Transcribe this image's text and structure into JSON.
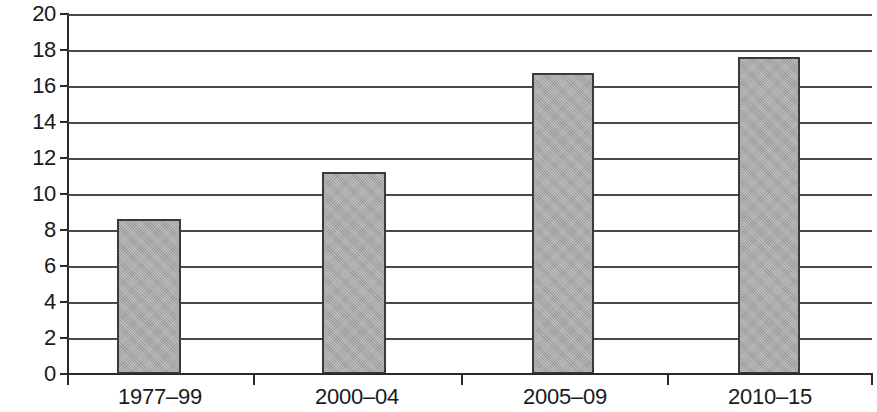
{
  "chart_data": {
    "type": "bar",
    "title": "",
    "subtitle": "",
    "xlabel": "",
    "ylabel": "",
    "categories": [
      "1977–99",
      "2000–04",
      "2005–09",
      "2010–15"
    ],
    "values": [
      8.6,
      11.2,
      16.7,
      17.6
    ],
    "series": [
      {
        "name": "",
        "values": [
          8.6,
          11.2,
          16.7,
          17.6
        ]
      }
    ],
    "ylim": [
      0,
      20
    ],
    "ytick_labels": [
      "0",
      "2",
      "4",
      "6",
      "8",
      "10",
      "12",
      "14",
      "16",
      "18",
      "20"
    ],
    "ytick_values": [
      0,
      2,
      4,
      6,
      8,
      10,
      12,
      14,
      16,
      18,
      20
    ],
    "ytick_step": 2,
    "grid": true,
    "grid_axis": "y",
    "legend": false,
    "legend_position": "none",
    "annotations": [],
    "colors": {
      "bar_fill": "#a9a9a9",
      "bar_border": "#3a3a3a",
      "gridline": "#4a4a4a",
      "axis": "#2b2b2b",
      "text": "#1a1a1a",
      "background": "#ffffff"
    }
  }
}
